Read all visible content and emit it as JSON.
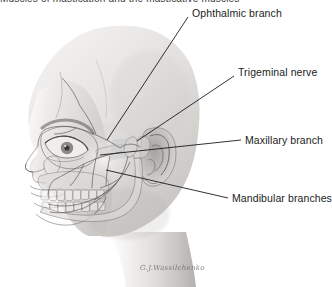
{
  "figure": {
    "heading_clipped": "Muscles of mastication and the masticative muscles",
    "alt_description": "Lateral view of a human head in profile facing left with a translucent skull and trigeminal nerve branches overlaid",
    "background_color": "#ffffff",
    "line_color": "#1b1b1b",
    "skin_tone_light": "#e9e7e5",
    "skin_tone_mid": "#c9c6c4",
    "skin_tone_dark": "#8e8b89",
    "bone_tone": "#dcdad7",
    "nerve_tone": "#9a9794",
    "highlight_patch": "#bfc4c8",
    "credit": "G.J.Wassilchenko"
  },
  "labels": [
    {
      "id": "ophthalmic-branch",
      "text": "Ophthalmic branch",
      "text_x": 192,
      "text_y": 7,
      "leader": {
        "x1": 188,
        "y1": 17,
        "x2": 107,
        "y2": 140
      }
    },
    {
      "id": "trigeminal-nerve",
      "text": "Trigeminal nerve",
      "text_x": 238,
      "text_y": 66,
      "leader": {
        "x1": 234,
        "y1": 76,
        "x2": 137,
        "y2": 141
      }
    },
    {
      "id": "maxillary-branch",
      "text": "Maxillary branch",
      "text_x": 245,
      "text_y": 134,
      "leader": {
        "x1": 241,
        "y1": 140,
        "x2": 100,
        "y2": 155
      }
    },
    {
      "id": "mandibular-branches",
      "text": "Mandibular branches",
      "text_x": 232,
      "text_y": 192,
      "leader": {
        "x1": 228,
        "y1": 198,
        "x2": 106,
        "y2": 170
      }
    }
  ]
}
